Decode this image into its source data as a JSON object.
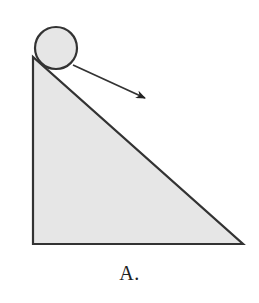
{
  "figure": {
    "label": "A.",
    "colors": {
      "fill": "#e6e6e6",
      "stroke": "#333333",
      "background": "#ffffff"
    },
    "ball": {
      "cx": 56,
      "cy": 48,
      "r": 21
    },
    "incline": {
      "points": "33,57 33,244 243,244"
    },
    "arrow": {
      "x1": 73,
      "y1": 65,
      "x2": 145,
      "y2": 98,
      "direction": "down-slope"
    }
  }
}
